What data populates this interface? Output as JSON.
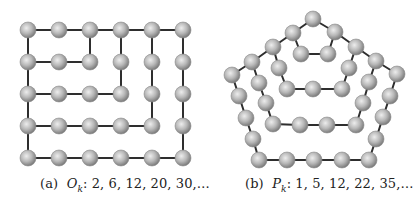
{
  "colors": {
    "background": "#ffffff",
    "edge": "#2e2e2e",
    "node_light": "#e6e6e6",
    "node_mid": "#b4b4b4",
    "node_dark": "#7a7a7a"
  },
  "node_radius": 8,
  "figures": [
    {
      "id": "a",
      "caption": {
        "label": "(a)",
        "symbol": "O",
        "subscript": "k",
        "sequence": ": 2, 6, 12, 20, 30,…"
      },
      "shape": "square-grid",
      "nodes": [
        [
          28,
          30
        ],
        [
          59,
          30
        ],
        [
          90,
          30
        ],
        [
          121,
          30
        ],
        [
          152,
          30
        ],
        [
          183,
          30
        ],
        [
          28,
          62
        ],
        [
          59,
          62
        ],
        [
          90,
          62
        ],
        [
          121,
          62
        ],
        [
          152,
          62
        ],
        [
          183,
          62
        ],
        [
          28,
          94
        ],
        [
          59,
          94
        ],
        [
          90,
          94
        ],
        [
          121,
          94
        ],
        [
          152,
          94
        ],
        [
          183,
          94
        ],
        [
          28,
          126
        ],
        [
          59,
          126
        ],
        [
          90,
          126
        ],
        [
          121,
          126
        ],
        [
          152,
          126
        ],
        [
          183,
          126
        ],
        [
          28,
          158
        ],
        [
          59,
          158
        ],
        [
          90,
          158
        ],
        [
          121,
          158
        ],
        [
          152,
          158
        ],
        [
          183,
          158
        ]
      ],
      "edges": [
        [
          0,
          1
        ],
        [
          1,
          2
        ],
        [
          2,
          3
        ],
        [
          3,
          4
        ],
        [
          4,
          5
        ],
        [
          0,
          6
        ],
        [
          6,
          12
        ],
        [
          12,
          18
        ],
        [
          18,
          24
        ],
        [
          6,
          7
        ],
        [
          7,
          8
        ],
        [
          8,
          2
        ],
        [
          12,
          13
        ],
        [
          13,
          14
        ],
        [
          14,
          15
        ],
        [
          15,
          9
        ],
        [
          9,
          3
        ],
        [
          18,
          19
        ],
        [
          19,
          20
        ],
        [
          20,
          21
        ],
        [
          21,
          22
        ],
        [
          22,
          16
        ],
        [
          16,
          10
        ],
        [
          10,
          4
        ],
        [
          24,
          25
        ],
        [
          25,
          26
        ],
        [
          26,
          27
        ],
        [
          27,
          28
        ],
        [
          28,
          29
        ],
        [
          29,
          23
        ],
        [
          23,
          17
        ],
        [
          17,
          11
        ],
        [
          11,
          5
        ]
      ]
    },
    {
      "id": "b",
      "caption": {
        "label": "(b)",
        "symbol": "P",
        "subscript": "k",
        "sequence": ": 1, 5, 12, 22, 35,…"
      },
      "shape": "nested-pentagon",
      "nodes": [
        [
          313,
          19
        ],
        [
          293,
          33
        ],
        [
          335,
          32
        ],
        [
          301,
          54
        ],
        [
          328,
          54
        ],
        [
          273,
          47
        ],
        [
          279,
          68
        ],
        [
          287,
          89
        ],
        [
          313,
          89
        ],
        [
          342,
          89
        ],
        [
          349,
          68
        ],
        [
          356,
          47
        ],
        [
          252,
          62
        ],
        [
          259,
          83
        ],
        [
          266,
          103
        ],
        [
          273,
          124
        ],
        [
          300,
          125
        ],
        [
          327,
          125
        ],
        [
          356,
          125
        ],
        [
          363,
          103
        ],
        [
          369,
          82
        ],
        [
          376,
          61
        ],
        [
          232,
          75
        ],
        [
          239,
          96
        ],
        [
          246,
          118
        ],
        [
          253,
          139
        ],
        [
          259,
          160
        ],
        [
          287,
          160
        ],
        [
          314,
          160
        ],
        [
          342,
          160
        ],
        [
          369,
          160
        ],
        [
          376,
          139
        ],
        [
          383,
          117
        ],
        [
          390,
          96
        ],
        [
          397,
          74
        ]
      ],
      "edges": [
        [
          0,
          1
        ],
        [
          0,
          2
        ],
        [
          1,
          3
        ],
        [
          2,
          4
        ],
        [
          3,
          4
        ],
        [
          1,
          5
        ],
        [
          5,
          6
        ],
        [
          6,
          7
        ],
        [
          7,
          8
        ],
        [
          8,
          9
        ],
        [
          9,
          10
        ],
        [
          10,
          11
        ],
        [
          11,
          2
        ],
        [
          5,
          12
        ],
        [
          12,
          13
        ],
        [
          13,
          14
        ],
        [
          14,
          15
        ],
        [
          15,
          16
        ],
        [
          16,
          17
        ],
        [
          17,
          18
        ],
        [
          18,
          19
        ],
        [
          19,
          20
        ],
        [
          20,
          21
        ],
        [
          21,
          11
        ],
        [
          12,
          22
        ],
        [
          22,
          23
        ],
        [
          23,
          24
        ],
        [
          24,
          25
        ],
        [
          25,
          26
        ],
        [
          26,
          27
        ],
        [
          27,
          28
        ],
        [
          28,
          29
        ],
        [
          29,
          30
        ],
        [
          30,
          31
        ],
        [
          31,
          32
        ],
        [
          32,
          33
        ],
        [
          33,
          34
        ],
        [
          34,
          21
        ]
      ]
    }
  ]
}
